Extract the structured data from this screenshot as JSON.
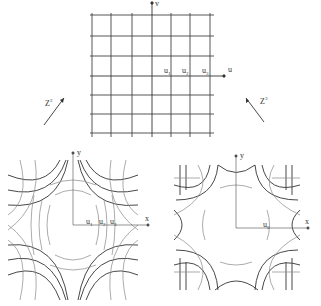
{
  "top_grid": {
    "axis_u_label": "u",
    "axis_v_label": "v",
    "markers": [
      {
        "label": "u",
        "sub": "1"
      },
      {
        "label": "u",
        "sub": "2"
      },
      {
        "label": "u",
        "sub": "3"
      }
    ]
  },
  "arrows": {
    "left": {
      "label": "Z",
      "sup": "2"
    },
    "right": {
      "label": "Z",
      "sup": "3"
    }
  },
  "bottom_left": {
    "axis_x_label": "x",
    "axis_y_label": "y",
    "markers": [
      {
        "label": "u",
        "sub": "1"
      },
      {
        "label": "u",
        "sub": "2"
      },
      {
        "label": "u",
        "sub": "3"
      }
    ]
  },
  "bottom_right": {
    "axis_x_label": "x",
    "axis_y_label": "y",
    "markers": [
      {
        "label": "u",
        "sub": "0"
      }
    ]
  },
  "colors": {
    "line_dark": "#333333",
    "line_light": "#888888"
  }
}
